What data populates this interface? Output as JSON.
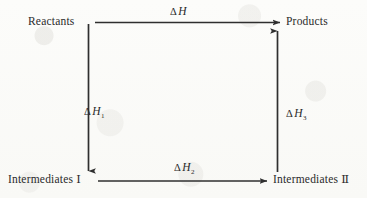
{
  "figure": {
    "kind": "hess-law-thermochemical-cycle",
    "ink_color": "#2a2a2a",
    "background_color": "#fbfbf9"
  },
  "nodes": {
    "reactants": {
      "label": "Reactants"
    },
    "products": {
      "label": "Products"
    },
    "intermediates_1": {
      "label": "Intermediates",
      "numeral": "Ⅰ"
    },
    "intermediates_2": {
      "label": "Intermediates",
      "numeral": "Ⅱ"
    }
  },
  "arrows": {
    "top": {
      "from": "Reactants",
      "to": "Products",
      "direction": "right",
      "delta": "Δ",
      "symbol": "H",
      "subscript": ""
    },
    "left": {
      "from": "Reactants",
      "to": "Intermediates Ⅰ",
      "direction": "down",
      "delta": "Δ",
      "symbol": "H",
      "subscript": "1"
    },
    "bottom": {
      "from": "Intermediates Ⅰ",
      "to": "Intermediates Ⅱ",
      "direction": "right",
      "delta": "Δ",
      "symbol": "H",
      "subscript": "2"
    },
    "right": {
      "from": "Intermediates Ⅱ",
      "to": "Products",
      "direction": "up",
      "delta": "Δ",
      "symbol": "H",
      "subscript": "3"
    }
  }
}
